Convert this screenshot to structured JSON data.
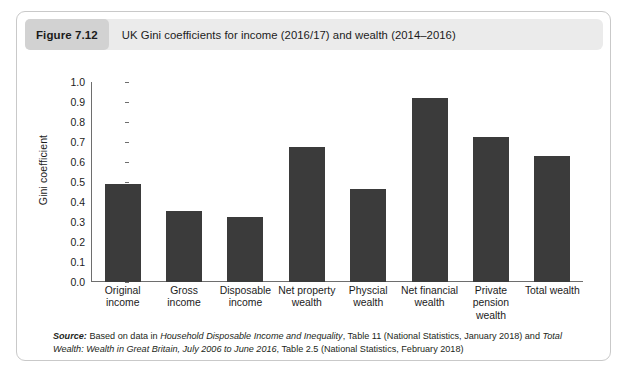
{
  "figure": {
    "number_label": "Figure 7.12",
    "title": "UK Gini coefficients for income (2016/17) and wealth (2014–2016)"
  },
  "source": {
    "label": "Source:",
    "part1": " Based on data in ",
    "italic1": "Household Disposable Income and Inequality",
    "part2": ", Table 11 (National Statistics, January 2018) and ",
    "italic2": "Total Wealth: Wealth in Great Britain, July 2006 to June 2016",
    "part3": ", Table 2.5 (National Statistics, February 2018)"
  },
  "colors": {
    "bar": "#3b3b3b",
    "axis": "#6e6e6e",
    "header_bg": "#ebebeb",
    "badge_bg": "#d2d2d2",
    "card_border": "#c9c9c9"
  },
  "chart_data": {
    "type": "bar",
    "title": "UK Gini coefficients for income (2016/17) and wealth (2014–2016)",
    "xlabel": "",
    "ylabel": "Gini coefficient",
    "ylim": [
      0.0,
      1.0
    ],
    "ytick_step": 0.1,
    "ytick_labels": [
      "0.0",
      "0.1",
      "0.2",
      "0.3",
      "0.4",
      "0.5",
      "0.6",
      "0.7",
      "0.8",
      "0.9",
      "1.0"
    ],
    "yticks": [
      0.0,
      0.1,
      0.2,
      0.3,
      0.4,
      0.5,
      0.6,
      0.7,
      0.8,
      0.9,
      1.0
    ],
    "grid": false,
    "legend": false,
    "categories": [
      "Original income",
      "Gross income",
      "Disposable income",
      "Net property wealth",
      "Physcial wealth",
      "Net financial wealth",
      "Private pension wealth",
      "Total wealth"
    ],
    "category_lines": [
      [
        "Original",
        "income"
      ],
      [
        "Gross",
        "income"
      ],
      [
        "Disposable",
        "income"
      ],
      [
        "Net property",
        "wealth"
      ],
      [
        "Physcial",
        "wealth"
      ],
      [
        "Net financial",
        "wealth"
      ],
      [
        "Private",
        "pension",
        "wealth"
      ],
      [
        "Total wealth"
      ]
    ],
    "values": [
      0.49,
      0.355,
      0.325,
      0.675,
      0.465,
      0.92,
      0.725,
      0.63
    ]
  }
}
